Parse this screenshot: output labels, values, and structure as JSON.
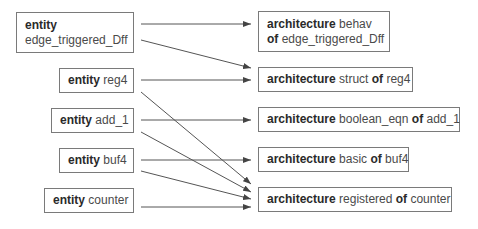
{
  "entities": [
    {
      "keyword": "entity",
      "name": "edge_triggered_Dff"
    },
    {
      "keyword": "entity",
      "name": "reg4"
    },
    {
      "keyword": "entity",
      "name": "add_1"
    },
    {
      "keyword": "entity",
      "name": "buf4"
    },
    {
      "keyword": "entity",
      "name": "counter"
    }
  ],
  "architectures": [
    {
      "keyword": "architecture",
      "name": "behav",
      "of": "of",
      "entity": "edge_triggered_Dff"
    },
    {
      "keyword": "architecture",
      "name": "struct",
      "of": "of",
      "entity": "reg4"
    },
    {
      "keyword": "architecture",
      "name": "boolean_eqn",
      "of": "of",
      "entity": "add_1"
    },
    {
      "keyword": "architecture",
      "name": "basic",
      "of": "of",
      "entity": "buf4"
    },
    {
      "keyword": "architecture",
      "name": "registered",
      "of": "of",
      "entity": "counter"
    }
  ],
  "connections": [
    {
      "from": "edge_triggered_Dff",
      "to": "behav of edge_triggered_Dff"
    },
    {
      "from": "edge_triggered_Dff",
      "to": "struct of reg4"
    },
    {
      "from": "reg4",
      "to": "struct of reg4"
    },
    {
      "from": "reg4",
      "to": "registered of counter"
    },
    {
      "from": "add_1",
      "to": "boolean_eqn of add_1"
    },
    {
      "from": "add_1",
      "to": "registered of counter"
    },
    {
      "from": "buf4",
      "to": "basic of buf4"
    },
    {
      "from": "buf4",
      "to": "registered of counter"
    },
    {
      "from": "counter",
      "to": "registered of counter"
    }
  ],
  "colors": {
    "line": "#555555",
    "border": "#7a7a7a"
  }
}
